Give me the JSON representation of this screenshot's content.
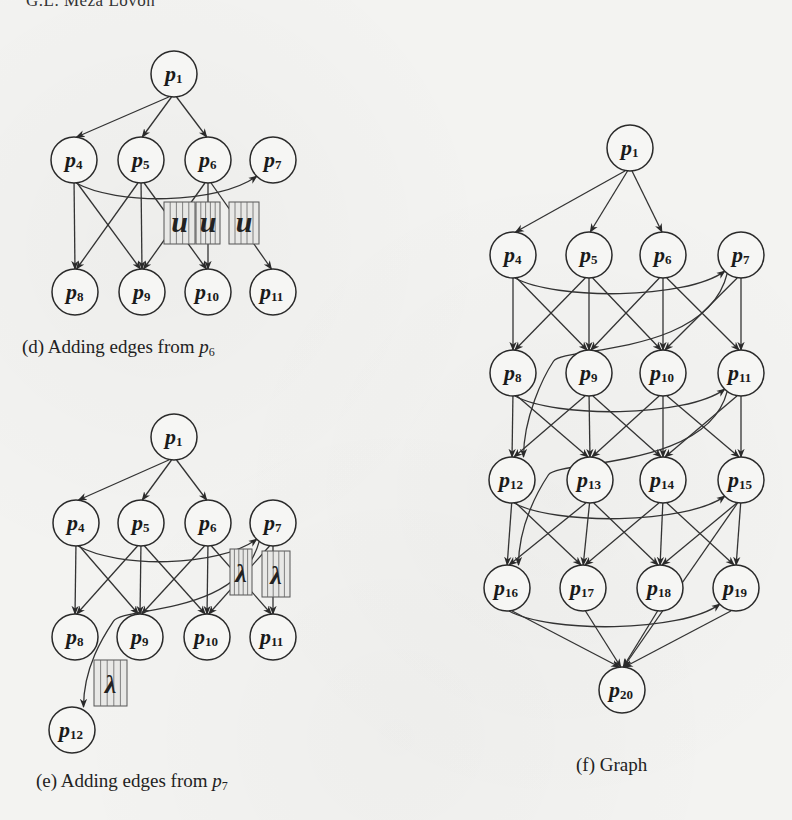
{
  "page": {
    "running_header": "G.L. Meza Lovón",
    "background_color": "#f3f3f1",
    "ink_color": "#1c1c1c"
  },
  "panels": [
    {
      "id": "d",
      "caption_prefix": "(d) Adding edges from ",
      "caption_var": "p",
      "caption_sub": "6",
      "nodes": [
        {
          "id": "p1",
          "base": "p",
          "sub": "1",
          "x": 174,
          "y": 74
        },
        {
          "id": "p4",
          "base": "p",
          "sub": "4",
          "x": 74,
          "y": 160
        },
        {
          "id": "p5",
          "base": "p",
          "sub": "5",
          "x": 141,
          "y": 160
        },
        {
          "id": "p6",
          "base": "p",
          "sub": "6",
          "x": 208,
          "y": 160
        },
        {
          "id": "p7",
          "base": "p",
          "sub": "7",
          "x": 273,
          "y": 160
        },
        {
          "id": "p8",
          "base": "p",
          "sub": "8",
          "x": 75,
          "y": 292
        },
        {
          "id": "p9",
          "base": "p",
          "sub": "9",
          "x": 142,
          "y": 292
        },
        {
          "id": "p10",
          "base": "p",
          "sub": "10",
          "x": 208,
          "y": 292
        },
        {
          "id": "p11",
          "base": "p",
          "sub": "11",
          "x": 273,
          "y": 292
        }
      ],
      "edges": [
        [
          "p1",
          "p4"
        ],
        [
          "p1",
          "p5"
        ],
        [
          "p1",
          "p6"
        ],
        [
          "p4",
          "p7"
        ],
        [
          "p4",
          "p8"
        ],
        [
          "p4",
          "p9"
        ],
        [
          "p5",
          "p8"
        ],
        [
          "p5",
          "p9"
        ],
        [
          "p5",
          "p10"
        ],
        [
          "p6",
          "p9"
        ],
        [
          "p6",
          "p10"
        ],
        [
          "p6",
          "p11"
        ]
      ],
      "glyphs": [
        "u-glyph",
        "u-glyph",
        "u-glyph"
      ]
    },
    {
      "id": "e",
      "caption_prefix": "(e) Adding edges from ",
      "caption_var": "p",
      "caption_sub": "7",
      "nodes": [
        {
          "id": "p1",
          "base": "p",
          "sub": "1",
          "x": 174,
          "y": 437
        },
        {
          "id": "p4",
          "base": "p",
          "sub": "4",
          "x": 76,
          "y": 523
        },
        {
          "id": "p5",
          "base": "p",
          "sub": "5",
          "x": 141,
          "y": 523
        },
        {
          "id": "p6",
          "base": "p",
          "sub": "6",
          "x": 208,
          "y": 523
        },
        {
          "id": "p7",
          "base": "p",
          "sub": "7",
          "x": 273,
          "y": 523
        },
        {
          "id": "p8",
          "base": "p",
          "sub": "8",
          "x": 75,
          "y": 637
        },
        {
          "id": "p9",
          "base": "p",
          "sub": "9",
          "x": 140,
          "y": 637
        },
        {
          "id": "p10",
          "base": "p",
          "sub": "10",
          "x": 207,
          "y": 637
        },
        {
          "id": "p11",
          "base": "p",
          "sub": "11",
          "x": 273,
          "y": 637
        },
        {
          "id": "p12",
          "base": "p",
          "sub": "12",
          "x": 72,
          "y": 730
        }
      ],
      "edges": [
        [
          "p1",
          "p4"
        ],
        [
          "p1",
          "p5"
        ],
        [
          "p1",
          "p6"
        ],
        [
          "p4",
          "p7"
        ],
        [
          "p4",
          "p8"
        ],
        [
          "p4",
          "p9"
        ],
        [
          "p5",
          "p8"
        ],
        [
          "p5",
          "p9"
        ],
        [
          "p5",
          "p10"
        ],
        [
          "p6",
          "p9"
        ],
        [
          "p6",
          "p10"
        ],
        [
          "p6",
          "p11"
        ],
        [
          "p7",
          "p10"
        ],
        [
          "p7",
          "p11"
        ],
        [
          "p7",
          "p12"
        ]
      ],
      "glyphs": [
        "lambda-glyph",
        "lambda-glyph",
        "lambda-glyph"
      ]
    },
    {
      "id": "f",
      "caption_prefix": "(f) Graph",
      "caption_var": "",
      "caption_sub": "",
      "nodes": [
        {
          "id": "p1",
          "base": "p",
          "sub": "1",
          "x": 630,
          "y": 148
        },
        {
          "id": "p4",
          "base": "p",
          "sub": "4",
          "x": 513,
          "y": 255
        },
        {
          "id": "p5",
          "base": "p",
          "sub": "5",
          "x": 589,
          "y": 255
        },
        {
          "id": "p6",
          "base": "p",
          "sub": "6",
          "x": 663,
          "y": 255
        },
        {
          "id": "p7",
          "base": "p",
          "sub": "7",
          "x": 741,
          "y": 255
        },
        {
          "id": "p8",
          "base": "p",
          "sub": "8",
          "x": 513,
          "y": 373
        },
        {
          "id": "p9",
          "base": "p",
          "sub": "9",
          "x": 589,
          "y": 373
        },
        {
          "id": "p10",
          "base": "p",
          "sub": "10",
          "x": 663,
          "y": 373
        },
        {
          "id": "p11",
          "base": "p",
          "sub": "11",
          "x": 741,
          "y": 373
        },
        {
          "id": "p12",
          "base": "p",
          "sub": "12",
          "x": 512,
          "y": 480
        },
        {
          "id": "p13",
          "base": "p",
          "sub": "13",
          "x": 590,
          "y": 480
        },
        {
          "id": "p14",
          "base": "p",
          "sub": "14",
          "x": 663,
          "y": 480
        },
        {
          "id": "p15",
          "base": "p",
          "sub": "15",
          "x": 741,
          "y": 480
        },
        {
          "id": "p16",
          "base": "p",
          "sub": "16",
          "x": 507,
          "y": 588
        },
        {
          "id": "p17",
          "base": "p",
          "sub": "17",
          "x": 583,
          "y": 588
        },
        {
          "id": "p18",
          "base": "p",
          "sub": "18",
          "x": 660,
          "y": 588
        },
        {
          "id": "p19",
          "base": "p",
          "sub": "19",
          "x": 736,
          "y": 588
        },
        {
          "id": "p20",
          "base": "p",
          "sub": "20",
          "x": 622,
          "y": 690
        }
      ],
      "edges": [
        [
          "p1",
          "p4"
        ],
        [
          "p1",
          "p5"
        ],
        [
          "p1",
          "p6"
        ],
        [
          "p4",
          "p7"
        ],
        [
          "p4",
          "p8"
        ],
        [
          "p4",
          "p9"
        ],
        [
          "p5",
          "p8"
        ],
        [
          "p5",
          "p9"
        ],
        [
          "p5",
          "p10"
        ],
        [
          "p6",
          "p9"
        ],
        [
          "p6",
          "p10"
        ],
        [
          "p6",
          "p11"
        ],
        [
          "p7",
          "p10"
        ],
        [
          "p7",
          "p11"
        ],
        [
          "p7",
          "p12"
        ],
        [
          "p8",
          "p11"
        ],
        [
          "p8",
          "p12"
        ],
        [
          "p8",
          "p13"
        ],
        [
          "p9",
          "p12"
        ],
        [
          "p9",
          "p13"
        ],
        [
          "p9",
          "p14"
        ],
        [
          "p10",
          "p13"
        ],
        [
          "p10",
          "p14"
        ],
        [
          "p10",
          "p15"
        ],
        [
          "p11",
          "p14"
        ],
        [
          "p11",
          "p15"
        ],
        [
          "p11",
          "p16"
        ],
        [
          "p12",
          "p15"
        ],
        [
          "p12",
          "p16"
        ],
        [
          "p12",
          "p17"
        ],
        [
          "p13",
          "p16"
        ],
        [
          "p13",
          "p17"
        ],
        [
          "p13",
          "p18"
        ],
        [
          "p14",
          "p17"
        ],
        [
          "p14",
          "p18"
        ],
        [
          "p14",
          "p19"
        ],
        [
          "p15",
          "p18"
        ],
        [
          "p15",
          "p19"
        ],
        [
          "p15",
          "p20"
        ],
        [
          "p16",
          "p19"
        ],
        [
          "p16",
          "p20"
        ],
        [
          "p17",
          "p20"
        ],
        [
          "p18",
          "p20"
        ],
        [
          "p19",
          "p20"
        ]
      ]
    }
  ]
}
